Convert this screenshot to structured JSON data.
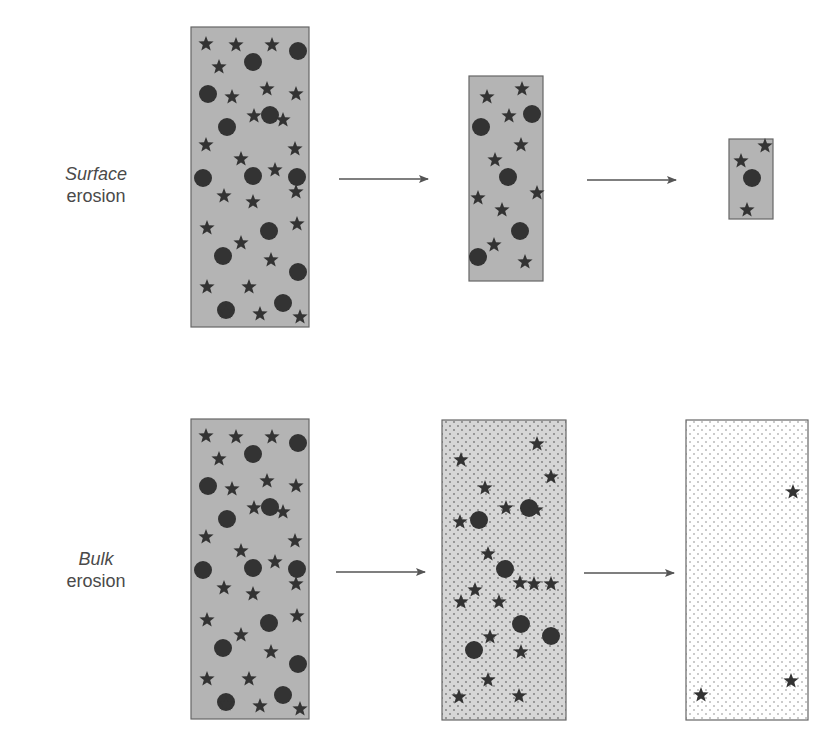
{
  "labels": {
    "surface": {
      "line1": "Surface",
      "line2": "erosion"
    },
    "bulk": {
      "line1": "Bulk",
      "line2": "erosion"
    }
  },
  "colors": {
    "matrix_gray": "#b4b4b4",
    "matrix_dotted_bg": "#d9d9d9",
    "matrix_white_bg": "#ffffff",
    "dot": "#8a8a8a",
    "particle": "#333333",
    "border": "#666666",
    "arrow": "#555555"
  },
  "rows": [
    {
      "name": "surface",
      "stages": [
        {
          "x": 191,
          "y": 27,
          "w": 118,
          "h": 300,
          "fill": "gray",
          "stars": [
            [
              206,
              44
            ],
            [
              236,
              45
            ],
            [
              272,
              45
            ],
            [
              219,
              67
            ],
            [
              232,
              97
            ],
            [
              267,
              89
            ],
            [
              296,
              94
            ],
            [
              254,
              116
            ],
            [
              283,
              120
            ],
            [
              206,
              145
            ],
            [
              241,
              159
            ],
            [
              295,
              149
            ],
            [
              275,
              170
            ],
            [
              224,
              196
            ],
            [
              253,
              202
            ],
            [
              296,
              192
            ],
            [
              207,
              228
            ],
            [
              241,
              243
            ],
            [
              297,
              224
            ],
            [
              271,
              260
            ],
            [
              207,
              287
            ],
            [
              249,
              287
            ],
            [
              226,
              312
            ],
            [
              260,
              314
            ],
            [
              300,
              317
            ]
          ],
          "circles": [
            [
              253,
              62
            ],
            [
              298,
              51
            ],
            [
              208,
              94
            ],
            [
              227,
              127
            ],
            [
              270,
              115
            ],
            [
              203,
              178
            ],
            [
              253,
              176
            ],
            [
              297,
              177
            ],
            [
              269,
              231
            ],
            [
              223,
              256
            ],
            [
              298,
              272
            ],
            [
              226,
              310
            ],
            [
              283,
              303
            ]
          ]
        },
        {
          "x": 469,
          "y": 76,
          "w": 74,
          "h": 205,
          "fill": "gray",
          "stars": [
            [
              487,
              97
            ],
            [
              522,
              89
            ],
            [
              509,
              116
            ],
            [
              521,
              145
            ],
            [
              495,
              160
            ],
            [
              478,
              198
            ],
            [
              502,
              210
            ],
            [
              537,
              193
            ],
            [
              494,
              245
            ],
            [
              525,
              262
            ]
          ],
          "circles": [
            [
              532,
              114
            ],
            [
              481,
              127
            ],
            [
              508,
              177
            ],
            [
              520,
              231
            ],
            [
              478,
              257
            ]
          ]
        },
        {
          "x": 729,
          "y": 139,
          "w": 44,
          "h": 80,
          "fill": "gray",
          "stars": [
            [
              765,
              146
            ],
            [
              741,
              161
            ],
            [
              747,
              210
            ]
          ],
          "circles": [
            [
              752,
              178
            ]
          ]
        }
      ]
    },
    {
      "name": "bulk",
      "stages": [
        {
          "x": 191,
          "y": 419,
          "w": 118,
          "h": 300,
          "fill": "gray",
          "stars": [
            [
              206,
              436
            ],
            [
              236,
              437
            ],
            [
              272,
              437
            ],
            [
              219,
              459
            ],
            [
              232,
              489
            ],
            [
              267,
              481
            ],
            [
              296,
              486
            ],
            [
              254,
              508
            ],
            [
              283,
              512
            ],
            [
              206,
              537
            ],
            [
              241,
              551
            ],
            [
              295,
              541
            ],
            [
              275,
              562
            ],
            [
              224,
              588
            ],
            [
              253,
              594
            ],
            [
              296,
              584
            ],
            [
              207,
              620
            ],
            [
              241,
              635
            ],
            [
              297,
              616
            ],
            [
              271,
              652
            ],
            [
              207,
              679
            ],
            [
              249,
              679
            ],
            [
              226,
              704
            ],
            [
              260,
              706
            ],
            [
              300,
              709
            ]
          ],
          "circles": [
            [
              253,
              454
            ],
            [
              298,
              443
            ],
            [
              208,
              486
            ],
            [
              227,
              519
            ],
            [
              270,
              507
            ],
            [
              203,
              570
            ],
            [
              253,
              568
            ],
            [
              297,
              569
            ],
            [
              269,
              623
            ],
            [
              223,
              648
            ],
            [
              298,
              664
            ],
            [
              226,
              702
            ],
            [
              283,
              695
            ]
          ]
        },
        {
          "x": 442,
          "y": 420,
          "w": 124,
          "h": 300,
          "fill": "dotted",
          "stars": [
            [
              537,
              444
            ],
            [
              461,
              460
            ],
            [
              551,
              477
            ],
            [
              485,
              488
            ],
            [
              460,
              522
            ],
            [
              506,
              508
            ],
            [
              536,
              510
            ],
            [
              488,
              554
            ],
            [
              534,
              584
            ],
            [
              551,
              584
            ],
            [
              461,
              602
            ],
            [
              475,
              590
            ],
            [
              499,
              602
            ],
            [
              520,
              583
            ],
            [
              490,
              637
            ],
            [
              521,
              652
            ],
            [
              488,
              680
            ],
            [
              459,
              697
            ],
            [
              519,
              696
            ]
          ],
          "circles": [
            [
              529,
              508
            ],
            [
              479,
              520
            ],
            [
              505,
              569
            ],
            [
              521,
              624
            ],
            [
              474,
              650
            ],
            [
              551,
              636
            ]
          ]
        },
        {
          "x": 686,
          "y": 420,
          "w": 122,
          "h": 300,
          "fill": "white",
          "stars": [
            [
              793,
              492
            ],
            [
              701,
              695
            ],
            [
              791,
              681
            ]
          ],
          "circles": []
        }
      ]
    }
  ],
  "arrows": [
    {
      "x1": 339,
      "y1": 179,
      "x2": 428,
      "y2": 179
    },
    {
      "x1": 587,
      "y1": 180,
      "x2": 676,
      "y2": 180
    },
    {
      "x1": 336,
      "y1": 572,
      "x2": 425,
      "y2": 572
    },
    {
      "x1": 584,
      "y1": 573,
      "x2": 674,
      "y2": 573
    }
  ]
}
